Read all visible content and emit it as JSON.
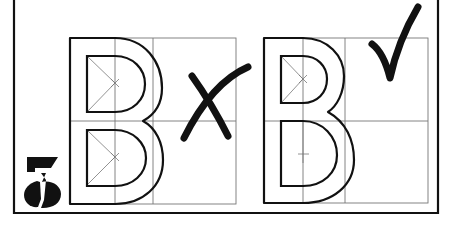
{
  "figure": {
    "step_number": "5",
    "examples": [
      {
        "id": "incorrect",
        "letter": "B",
        "verdict": "incorrect",
        "mark": "cross-mark"
      },
      {
        "id": "correct",
        "letter": "B",
        "verdict": "correct",
        "mark": "check-mark"
      }
    ],
    "colors": {
      "ink": "#111111",
      "grid": "#777777",
      "paper": "#ffffff"
    }
  }
}
